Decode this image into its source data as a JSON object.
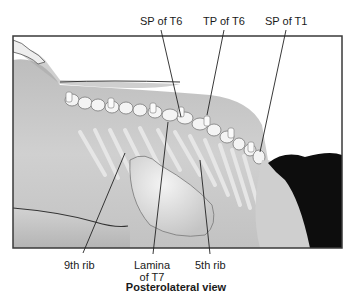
{
  "figure": {
    "caption": "Posterolateral view",
    "top_labels": [
      {
        "id": "sp-t6",
        "text": "SP of T6"
      },
      {
        "id": "tp-t6",
        "text": "TP of T6"
      },
      {
        "id": "sp-t1",
        "text": "SP of T1"
      }
    ],
    "bottom_labels": [
      {
        "id": "rib-9",
        "text": "9th rib"
      },
      {
        "id": "lamina-t7",
        "line1": "Lamina",
        "line2": "of T7"
      },
      {
        "id": "rib-5",
        "text": "5th rib"
      }
    ]
  },
  "colors": {
    "frame": "#3a3a3a",
    "skin": "#c9c9c9",
    "skin_dark": "#9a9a9a",
    "bone": "#f2f2f2",
    "hair": "#0d0d0d",
    "leader": "#222222"
  }
}
